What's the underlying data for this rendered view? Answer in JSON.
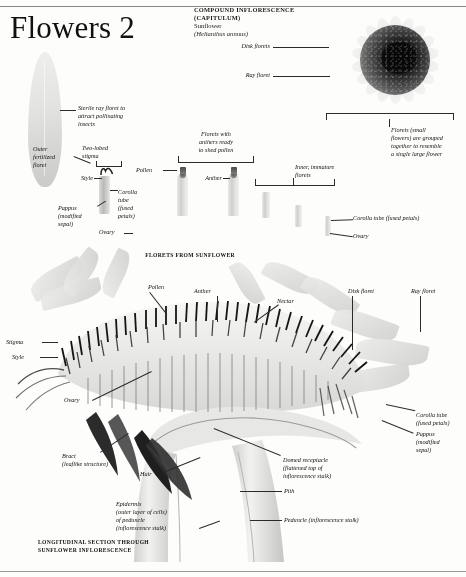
{
  "page": {
    "title": "Flowers 2",
    "header": {
      "line1": "COMPOUND INFLORESCENCE",
      "line2": "(CAPITULUM)",
      "common_name": "Sunflower",
      "latin_name": "(Helianthus annuus)"
    },
    "captions": {
      "middle": "FLORETS FROM SUNFLOWER",
      "bottom_line1": "LONGITUDINAL SECTION THROUGH",
      "bottom_line2": "SUNFLOWER INFLORESCENCE"
    }
  },
  "top_diagram": {
    "labels": {
      "disk_florets": "Disk florets",
      "ray_floret": "Ray floret",
      "bracket_note": "Florets (small\nflowers) are grouped\ntogether to resemble\na single large flower"
    }
  },
  "florets_diagram": {
    "labels": {
      "sterile_ray": "Sterile ray floret to\nattract pollinating\ninsects",
      "outer_fertilized": "Outer\nfertilized\nfloret",
      "two_lobed_stigma": "Two-lobed\nstigma",
      "style": "Style",
      "pollen": "Pollen",
      "florets_anthers": "Florets with\nanthers ready\nto shed pollen",
      "anther": "Anther",
      "corolla_tube": "Corolla\ntube\n(fused\npetals)",
      "pappus": "Pappus\n(modified\nsepal)",
      "ovary": "Ovary",
      "inner_immature": "Inner, immature\nflorets",
      "corolla_tube_right": "Corolla tube (fused petals)",
      "ovary_right": "Ovary"
    }
  },
  "section_diagram": {
    "labels": {
      "pollen": "Pollen",
      "anther": "Anther",
      "nectar": "Nectar",
      "disk_floret": "Disk floret",
      "ray_floret": "Ray floret",
      "stigma": "Stigma",
      "style": "Style",
      "ovary": "Ovary",
      "bract": "Bract\n(leaflike structure)",
      "hair": "Hair",
      "corolla_tube": "Corolla tube\n(fused petals)",
      "pappus": "Pappus\n(modified\nsepal)",
      "domed_receptacle": "Domed receptacle\n(flattened top of\ninflorescence stalk)",
      "pith": "Pith",
      "epidermis": "Epidermis\n(outer layer of cells)\nof peduncle\n(inflorescence stalk)",
      "peduncle": "Peduncle (inflorescence stalk)"
    }
  },
  "colors": {
    "paper": "#fdfdfb",
    "ink": "#111111",
    "leader": "#2b2b2b",
    "disc_dark": "#0d0d0d",
    "petal_pale": "#e3e3e2"
  }
}
